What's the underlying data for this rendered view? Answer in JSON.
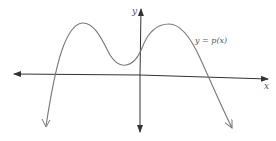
{
  "diagram": {
    "type": "function-graph",
    "x_axis_label": "x",
    "y_axis_label": "y",
    "curve_label": "y = p(x)",
    "colors": {
      "axis": "#333333",
      "curve": "#777777",
      "label": "#555555"
    }
  }
}
